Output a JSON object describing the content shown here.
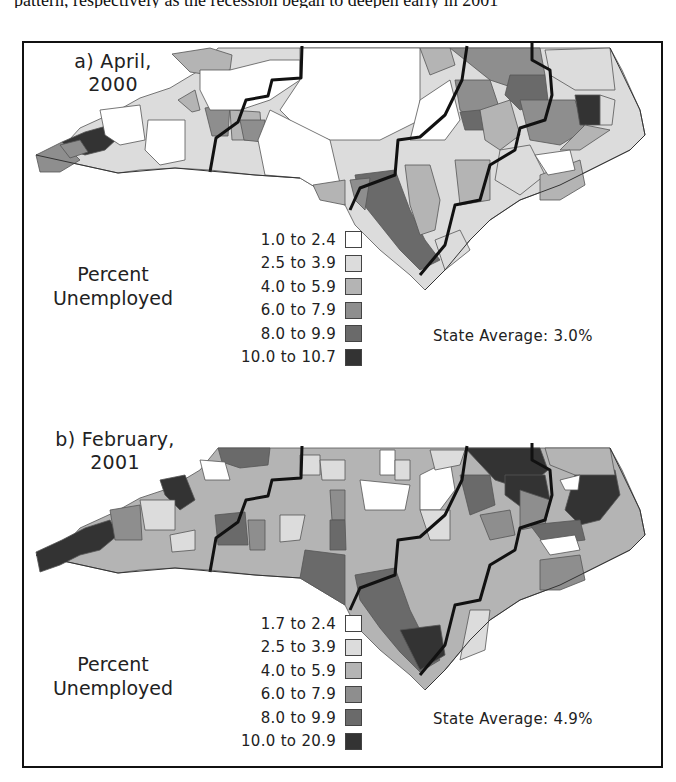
{
  "page": {
    "cut_text": "pattern, respectively as the recession began to deepen early in 2001"
  },
  "colors": {
    "class1": "#ffffff",
    "class2": "#dcdcdc",
    "class3": "#b4b4b4",
    "class4": "#8e8e8e",
    "class5": "#6a6a6a",
    "class6": "#333333",
    "boundary": "#111111",
    "county_line": "#555555"
  },
  "panels": [
    {
      "title_line1": "a) April,",
      "title_line2": "2000",
      "legend_title_line1": "Percent",
      "legend_title_line2": "Unemployed",
      "legend": [
        {
          "label": "1.0 to 2.4",
          "color": "#ffffff"
        },
        {
          "label": "2.5 to 3.9",
          "color": "#dcdcdc"
        },
        {
          "label": "4.0 to 5.9",
          "color": "#b4b4b4"
        },
        {
          "label": "6.0 to 7.9",
          "color": "#8e8e8e"
        },
        {
          "label": "8.0 to 9.9",
          "color": "#6a6a6a"
        },
        {
          "label": "10.0 to 10.7",
          "color": "#333333"
        }
      ],
      "state_average": "State Average: 3.0%"
    },
    {
      "title_line1": "b) February,",
      "title_line2": "2001",
      "legend_title_line1": "Percent",
      "legend_title_line2": "Unemployed",
      "legend": [
        {
          "label": "1.7 to 2.4",
          "color": "#ffffff"
        },
        {
          "label": "2.5 to 3.9",
          "color": "#dcdcdc"
        },
        {
          "label": "4.0 to 5.9",
          "color": "#b4b4b4"
        },
        {
          "label": "6.0 to 7.9",
          "color": "#8e8e8e"
        },
        {
          "label": "8.0 to 9.9",
          "color": "#6a6a6a"
        },
        {
          "label": "10.0 to 20.9",
          "color": "#333333"
        }
      ],
      "state_average": "State Average: 4.9%"
    }
  ]
}
